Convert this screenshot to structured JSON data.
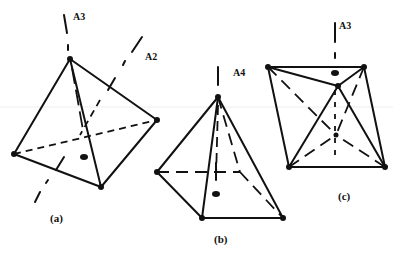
{
  "figure": {
    "panels": [
      {
        "id": "a",
        "label": "(a)",
        "shape": "tetrahedron",
        "axes": [
          {
            "label": "A3"
          },
          {
            "label": "A2"
          }
        ]
      },
      {
        "id": "b",
        "label": "(b)",
        "shape": "square pyramid",
        "axes": [
          {
            "label": "A4"
          }
        ]
      },
      {
        "id": "c",
        "label": "(c)",
        "shape": "trigonal bipyramid / octahedral view",
        "axes": [
          {
            "label": "A3"
          }
        ]
      }
    ]
  }
}
